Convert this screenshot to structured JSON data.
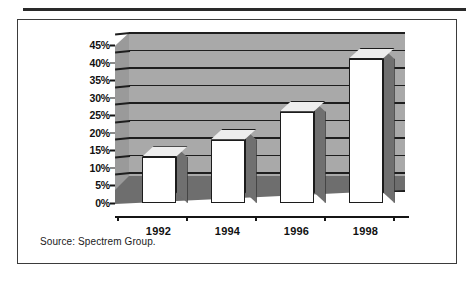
{
  "figure": {
    "caption": "Source:  Spectrem Group.",
    "frame_color": "#3b3b3b",
    "rule_color": "#2a2a2a"
  },
  "chart_data": {
    "type": "bar",
    "title": "",
    "subtitle": "",
    "xlabel": "",
    "ylabel": "",
    "categories": [
      "1992",
      "1994",
      "1996",
      "1998"
    ],
    "values": [
      13,
      18,
      26,
      41
    ],
    "ylim": [
      0,
      45
    ],
    "ytick_step": 5,
    "ytick_labels": [
      "0%",
      "5%",
      "10%",
      "15%",
      "20%",
      "25%",
      "30%",
      "35%",
      "40%",
      "45%"
    ],
    "ytick_values": [
      0,
      5,
      10,
      15,
      20,
      25,
      30,
      35,
      40,
      45
    ],
    "grid": true,
    "grid_orientation": "horizontal",
    "legend": false,
    "legend_position": "none",
    "style": "3d-columns",
    "series": [
      {
        "name": "",
        "values": [
          13,
          18,
          26,
          41
        ]
      }
    ],
    "colors": {
      "bar_front": "#ffffff",
      "bar_top": "#ededed",
      "bar_side": "#707070",
      "bar_outline": "#1c1c1c",
      "back_wall": "#a9a9a9",
      "left_wall": "#9a9a9a",
      "floor": "#6e6e6e",
      "gridline": "#1e1e1e",
      "text": "#111111"
    }
  }
}
